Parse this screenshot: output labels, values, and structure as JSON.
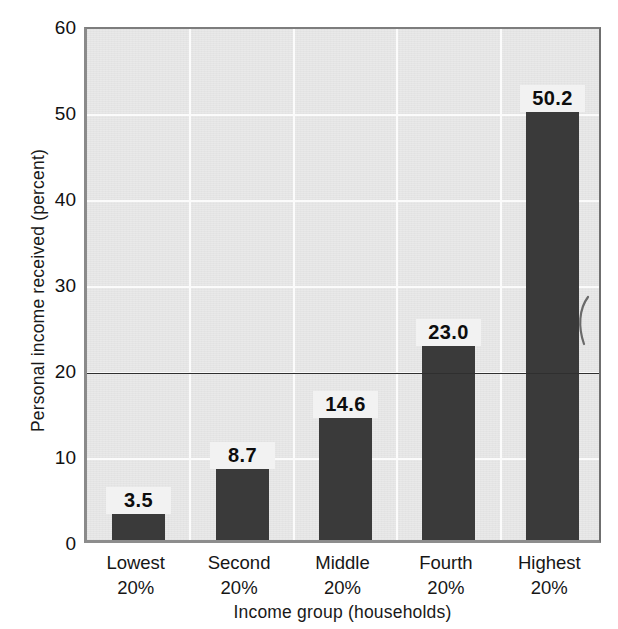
{
  "chart_data": {
    "type": "bar",
    "title": "",
    "categories": [
      "Lowest 20%",
      "Second 20%",
      "Middle 20%",
      "Fourth 20%",
      "Highest 20%"
    ],
    "category_lines": [
      [
        "Lowest",
        "20%"
      ],
      [
        "Second",
        "20%"
      ],
      [
        "Middle",
        "20%"
      ],
      [
        "Fourth",
        "20%"
      ],
      [
        "Highest",
        "20%"
      ]
    ],
    "values": [
      3.5,
      8.7,
      14.6,
      23.0,
      50.2
    ],
    "value_labels": [
      "3.5",
      "8.7",
      "14.6",
      "23.0",
      "50.2"
    ],
    "xlabel": "Income group (households)",
    "ylabel": "Personal income received (percent)",
    "ylim": [
      0,
      60
    ],
    "ytick_values": [
      0,
      10,
      20,
      30,
      40,
      50,
      60
    ],
    "ytick_labels": [
      "0",
      "10",
      "20",
      "30",
      "40",
      "50",
      "60"
    ],
    "grid": true,
    "grid_axis": "both",
    "legend": "none",
    "reference_line": 20,
    "colors": {
      "bar": "#3a3a3a",
      "plot_background": "#e9e9e9",
      "gridline": "#fbfbfb",
      "reference_line": "#2f2f2f",
      "axis_frame": "#8a8a8a",
      "text": "#161616",
      "page_background": "#ffffff"
    }
  }
}
